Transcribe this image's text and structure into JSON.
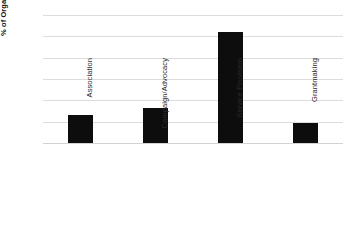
{
  "chart_data": {
    "type": "bar",
    "title": "",
    "xlabel": "",
    "ylabel": "% of Organisations",
    "categories": [
      "Association",
      "Campaign/Advocacy",
      "Service Provision",
      "Grantmaking"
    ],
    "values": [
      13,
      16.5,
      52,
      9.3
    ],
    "ylim": [
      0,
      60
    ],
    "yticks": [
      60,
      50,
      40,
      30,
      20,
      10,
      0
    ],
    "ytick_labels": [
      "60",
      "50",
      "40",
      "30",
      "20",
      "10",
      "0"
    ],
    "grid": true,
    "legend": false,
    "bar_color": "#0d0d0d",
    "grid_color": "#dcdcdc"
  },
  "axis": {
    "y_title": "% of Organisations"
  },
  "header": {
    "cropped_title": ""
  }
}
